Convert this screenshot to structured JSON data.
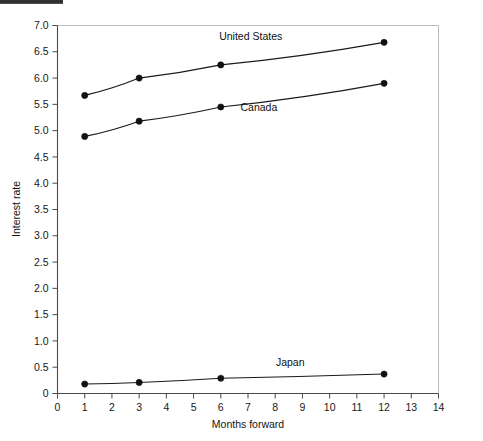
{
  "page": {
    "background_color": "#ffffff",
    "scan_artifact": {
      "name": "scan-edge-bar",
      "color": "#2d2d2d"
    }
  },
  "chart_data": {
    "type": "line",
    "title": "",
    "subtitle": "",
    "xlabel": "Months forward",
    "ylabel": "Interest rate",
    "x": [
      1,
      3,
      6,
      12
    ],
    "xlim": [
      0,
      14
    ],
    "ylim": [
      0,
      7.0
    ],
    "xticks": [
      0,
      1,
      2,
      3,
      4,
      5,
      6,
      7,
      8,
      9,
      10,
      11,
      12,
      13,
      14
    ],
    "xticklabels": [
      "0",
      "1",
      "2",
      "3",
      "4",
      "5",
      "6",
      "7",
      "8",
      "9",
      "10",
      "11",
      "12",
      "13",
      "14"
    ],
    "yticks": [
      0,
      0.5,
      1.0,
      1.5,
      2.0,
      2.5,
      3.0,
      3.5,
      4.0,
      4.5,
      5.0,
      5.5,
      6.0,
      6.5,
      7.0
    ],
    "yticklabels": [
      "0",
      "0.5",
      "1.0",
      "1.5",
      "2.0",
      "2.5",
      "3.0",
      "3.5",
      "4.0",
      "4.5",
      "5.0",
      "5.5",
      "6.0",
      "6.5",
      "7.0"
    ],
    "grid": false,
    "legend": "inline-annotations",
    "marker": "filled-circle",
    "line_color": "#1a1a1a",
    "marker_color": "#111111",
    "series": [
      {
        "name": "United States",
        "values": [
          5.67,
          6.0,
          6.25,
          6.68
        ],
        "label_x": 7.1,
        "label_y": 6.72
      },
      {
        "name": "Canada",
        "values": [
          4.89,
          5.18,
          5.45,
          5.9
        ],
        "label_x": 7.4,
        "label_y": 5.37
      },
      {
        "name": "Japan",
        "values": [
          0.18,
          0.21,
          0.29,
          0.37
        ],
        "label_x": 8.55,
        "label_y": 0.52
      }
    ]
  },
  "axes": {
    "x_axis_name": "x-axis",
    "y_axis_name": "y-axis",
    "frame_color": "#bdbdbd",
    "axis_color": "#4a4a4a"
  }
}
